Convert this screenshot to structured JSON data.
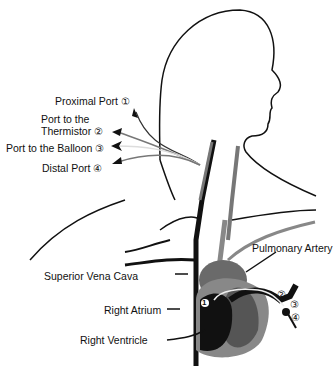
{
  "ports": [
    {
      "label": "Proximal Port",
      "num": "①"
    },
    {
      "label_line1": "Port to the",
      "label_line2": "Thermistor",
      "num": "②"
    },
    {
      "label": "Port to the Balloon",
      "num": "③"
    },
    {
      "label": "Distal Port",
      "num": "④"
    }
  ],
  "anatomy": {
    "svc": "Superior Vena Cava",
    "ra": "Right Atrium",
    "rv": "Right Ventricle",
    "pa": "Pulmonary Artery"
  },
  "tip_markers": [
    "②",
    "③",
    "④"
  ],
  "chamber_marker": "1",
  "colors": {
    "dark": "#111111",
    "mid": "#666666",
    "light": "#9a9a9a",
    "catheter_light": "#e8e8e8"
  }
}
